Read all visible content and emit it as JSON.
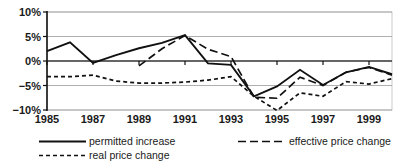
{
  "chart_data": {
    "type": "line",
    "title": "",
    "subtitle": "",
    "xlabel": "",
    "ylabel": "",
    "xlim": [
      1985,
      2000
    ],
    "ylim": [
      -10,
      10
    ],
    "grid": true,
    "legend_position": "bottom",
    "x_tick_labels": [
      "1985",
      "1987",
      "1989",
      "1991",
      "1993",
      "1995",
      "1997",
      "1999"
    ],
    "x_ticks": [
      1985,
      1987,
      1989,
      1991,
      1993,
      1995,
      1997,
      1999
    ],
    "y_tick_labels": [
      "10%",
      "5%",
      "0%",
      "−5%",
      "−10%"
    ],
    "y_ticks": [
      10,
      5,
      0,
      -5,
      -10
    ],
    "x": [
      1985,
      1986,
      1987,
      1988,
      1989,
      1990,
      1991,
      1992,
      1993,
      1994,
      1995,
      1996,
      1997,
      1998,
      1999,
      2000
    ],
    "series": [
      {
        "name": "permitted increase",
        "style": "solid",
        "values": [
          2.0,
          3.8,
          -0.4,
          1.2,
          2.6,
          3.7,
          5.3,
          -0.5,
          -0.8,
          -7.2,
          -5.2,
          -1.8,
          -4.9,
          -2.3,
          -1.2,
          -2.7
        ]
      },
      {
        "name": "real price change",
        "style": "dotted",
        "values": [
          -3.2,
          -3.2,
          -2.9,
          -4.1,
          -4.5,
          -4.5,
          -4.3,
          -3.9,
          -3.2,
          -7.2,
          -10.1,
          -6.5,
          -7.2,
          -4.2,
          -4.7,
          -3.6
        ]
      },
      {
        "name": "effective price change",
        "style": "dashed",
        "start_year": 1989,
        "values": [
          null,
          null,
          null,
          null,
          -1.0,
          2.5,
          5.2,
          2.4,
          0.9,
          -7.4,
          -7.6,
          -3.3,
          -5.0,
          -2.3,
          -1.3,
          -2.9
        ]
      }
    ]
  },
  "legend": {
    "items": [
      {
        "label": "permitted increase",
        "style": "solid"
      },
      {
        "label": "effective price change",
        "style": "dashed"
      },
      {
        "label": "real price change",
        "style": "dotted"
      }
    ]
  }
}
